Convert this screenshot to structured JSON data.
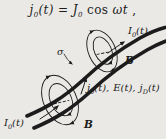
{
  "figure": {
    "equation": {
      "p1": "j",
      "p1_sub": "0",
      "p2": "(t) = J",
      "p2_sub": "0",
      "p3": " cos ",
      "p4": "ωt",
      "p5": " ,"
    },
    "diagram": {
      "labels": {
        "current_top": {
          "base": "I",
          "sub": "0",
          "rest": "(t)"
        },
        "current_bottom": {
          "base": "I",
          "sub": "0",
          "rest": "(t)"
        },
        "b_upper": "B",
        "b_lower": "B",
        "sigma": "σ",
        "densities": {
          "j_base": "j",
          "j_sub": "0",
          "j_rest": "(t),",
          "e": "E(t),",
          "jd_base": "j",
          "jd_sub": "D",
          "jd_rest": "(t)"
        }
      }
    },
    "colors": {
      "ink": "#1c1c1c",
      "paper": "#eae9e6"
    }
  }
}
